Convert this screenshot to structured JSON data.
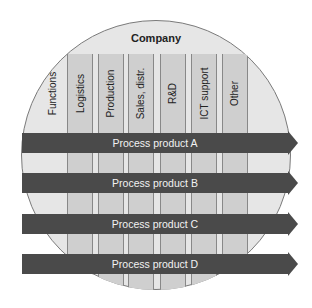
{
  "diagram": {
    "title": "Company",
    "functions_label": "Functions",
    "columns": [
      {
        "label": "Logistics"
      },
      {
        "label": "Production"
      },
      {
        "label": "Sales, distr."
      },
      {
        "label": "R&D"
      },
      {
        "label": "ICT support"
      },
      {
        "label": "Other"
      }
    ],
    "processes": [
      {
        "label": "Process product A"
      },
      {
        "label": "Process product B"
      },
      {
        "label": "Process product C"
      },
      {
        "label": "Process product D"
      }
    ],
    "colors": {
      "circle_fill": "#e6e6e6",
      "column_fill": "#cfcfcf",
      "bar_fill": "#4a4a4a",
      "bar_text": "#f2f2f2"
    }
  }
}
